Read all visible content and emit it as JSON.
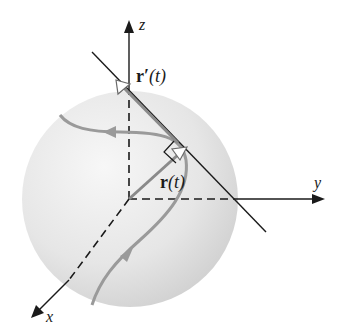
{
  "diagram": {
    "axes": {
      "z_label": "z",
      "y_label": "y",
      "x_label": "x"
    },
    "vectors": {
      "position_label_bold": "r",
      "position_label_arg": "(t)",
      "tangent_label_bold": "r′",
      "tangent_label_arg": "(t)"
    },
    "colors": {
      "sphere_light": "#f4f4f4",
      "sphere_dark": "#cfcfcf",
      "curve": "#9a9a9a",
      "axis": "#1a1a1a"
    }
  }
}
